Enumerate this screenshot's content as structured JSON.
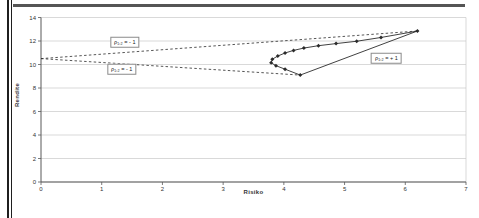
{
  "page": {
    "type": "scanned-figure",
    "background": "#ffffff",
    "border_colors": {
      "left_double_line": "#1f1f1f",
      "top_rule": "#555555"
    }
  },
  "chart_data": {
    "type": "line",
    "title": "",
    "xlabel": "Risiko",
    "ylabel": "Rendite",
    "xlim": [
      0,
      7
    ],
    "ylim": [
      0,
      14
    ],
    "x_ticks": [
      0,
      1,
      2,
      3,
      4,
      5,
      6,
      7
    ],
    "y_ticks": [
      0,
      2,
      4,
      6,
      8,
      10,
      12,
      14
    ],
    "grid": "horizontal",
    "legend": "none",
    "colors": {
      "grid": "#c9c9c9",
      "axis": "#595959",
      "series": "#2b2b2b",
      "tick_text": "#333333"
    },
    "series": [
      {
        "name": "rho-minus-1-upper",
        "style": "dashed",
        "marker": false,
        "points": [
          [
            0,
            10.5
          ],
          [
            6.2,
            12.85
          ]
        ]
      },
      {
        "name": "rho-minus-1-lower",
        "style": "dashed",
        "marker": false,
        "points": [
          [
            0,
            10.5
          ],
          [
            4.27,
            9.1
          ]
        ]
      },
      {
        "name": "rho-plus-1",
        "style": "solid",
        "marker": false,
        "points": [
          [
            4.27,
            9.1
          ],
          [
            6.2,
            12.85
          ]
        ]
      },
      {
        "name": "frontier",
        "style": "solid",
        "marker": true,
        "points": [
          [
            4.27,
            9.1
          ],
          [
            4.02,
            9.6
          ],
          [
            3.87,
            9.9
          ],
          [
            3.79,
            10.15
          ],
          [
            3.81,
            10.45
          ],
          [
            3.9,
            10.72
          ],
          [
            4.02,
            10.98
          ],
          [
            4.16,
            11.2
          ],
          [
            4.33,
            11.4
          ],
          [
            4.57,
            11.6
          ],
          [
            4.86,
            11.78
          ],
          [
            5.2,
            11.98
          ],
          [
            5.6,
            12.3
          ],
          [
            6.2,
            12.85
          ]
        ]
      }
    ],
    "annotations": [
      {
        "name": "rho-minus-1-upper-label",
        "text": "ρ₁,₂ = - 1",
        "x": 1.38,
        "y": 11.9
      },
      {
        "name": "rho-minus-1-lower-label",
        "text": "ρ₁,₂ = - 1",
        "x": 1.33,
        "y": 9.6
      },
      {
        "name": "rho-plus-1-label",
        "text": "ρ₁,₂ = + 1",
        "x": 5.69,
        "y": 10.55
      }
    ]
  }
}
